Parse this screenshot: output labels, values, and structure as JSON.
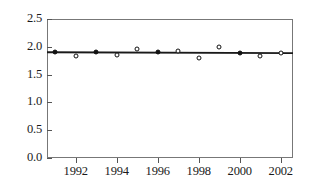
{
  "chart_data": {
    "type": "scatter",
    "title": "",
    "subtitle": "",
    "xlabel": "",
    "ylabel": "",
    "grid": false,
    "legend": false,
    "xlim": [
      1990.6,
      2002.6
    ],
    "ylim": [
      0.0,
      2.5
    ],
    "x_ticks": [
      1992,
      1994,
      1996,
      1998,
      2000,
      2002
    ],
    "x_tick_labels": [
      "1992",
      "1994",
      "1996",
      "1998",
      "2000",
      "2002"
    ],
    "y_ticks": [
      0.0,
      0.5,
      1.0,
      1.5,
      2.0,
      2.5
    ],
    "y_tick_labels": [
      "0.0",
      "0.5",
      "1.0",
      "1.5",
      "2.0",
      "2.5"
    ],
    "x": [
      1991,
      1992,
      1993,
      1994,
      1995,
      1996,
      1997,
      1998,
      1999,
      2000,
      2001,
      2002
    ],
    "values": [
      1.9,
      1.84,
      1.9,
      1.85,
      1.96,
      1.91,
      1.93,
      1.8,
      2.0,
      1.89,
      1.83,
      1.88
    ],
    "marker_filled": [
      true,
      false,
      true,
      false,
      false,
      true,
      false,
      false,
      false,
      true,
      false,
      false
    ],
    "series": [
      {
        "name": "observations",
        "values": [
          1.9,
          1.84,
          1.9,
          1.85,
          1.96,
          1.91,
          1.93,
          1.8,
          2.0,
          1.89,
          1.83,
          1.88
        ]
      },
      {
        "name": "trend-line",
        "type": "line",
        "x": [
          1990.6,
          2002.6
        ],
        "values": [
          1.902,
          1.886
        ]
      }
    ],
    "annotations": [],
    "colors": {
      "marker_edge": "#111111",
      "marker_fill": "#ffffff",
      "trend_line": "#1a1a1a",
      "axis": "#777777",
      "background": "#ffffff"
    }
  }
}
